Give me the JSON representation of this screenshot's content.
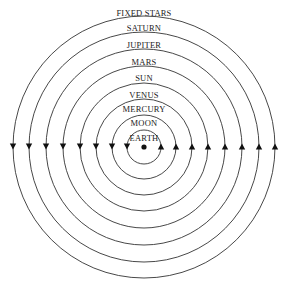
{
  "center": {
    "x": 144,
    "y": 147
  },
  "earth": {
    "label": "EARTH"
  },
  "spheres": [
    {
      "label": "MOON",
      "r": 32,
      "label_y": 124
    },
    {
      "label": "MERCURY",
      "r": 48,
      "label_y": 111
    },
    {
      "label": "VENUS",
      "r": 64,
      "label_y": 96
    },
    {
      "label": "SUN",
      "r": 81,
      "label_y": 79
    },
    {
      "label": "MARS",
      "r": 98,
      "label_y": 63
    },
    {
      "label": "JUPITER",
      "r": 115,
      "label_y": 46
    },
    {
      "label": "SATURN",
      "r": 131,
      "label_y": 29
    },
    {
      "label": "FIXED STARS",
      "r": 0,
      "label_y": 13
    }
  ],
  "earth_circle_r": 17,
  "arrow_direction": "counterclockwise",
  "colors": {
    "line": "#333333",
    "background": "#ffffff"
  }
}
